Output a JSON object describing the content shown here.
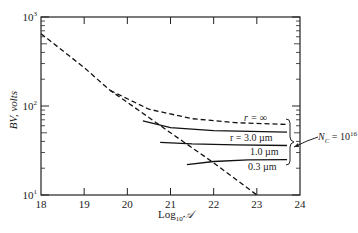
{
  "chart_data": {
    "type": "line",
    "title": "",
    "xlabel": "Log10 𝒜",
    "ylabel": "BV, volts",
    "xlim": [
      18,
      24
    ],
    "ylim": [
      10,
      1000
    ],
    "yscale": "log",
    "grid": false,
    "x_ticks": [
      "18",
      "19",
      "20",
      "21",
      "22",
      "23",
      "24"
    ],
    "y_ticks": [
      {
        "base": "10",
        "exp": "1"
      },
      {
        "base": "10",
        "exp": "2"
      },
      {
        "base": "10",
        "exp": "3"
      }
    ],
    "series": [
      {
        "name": "planar limit (dashed)",
        "style": "dashed",
        "points": [
          [
            18,
            650
          ],
          [
            19,
            270
          ],
          [
            19.6,
            150
          ],
          [
            20,
            110
          ],
          [
            21,
            50
          ],
          [
            22,
            23
          ],
          [
            23,
            10
          ]
        ]
      },
      {
        "name": "r = ∞",
        "style": "dashed",
        "points": [
          [
            19.6,
            150
          ],
          [
            20.5,
            92
          ],
          [
            21.5,
            72
          ],
          [
            22.5,
            65
          ],
          [
            23.7,
            62
          ]
        ]
      },
      {
        "name": "r = 3.0 µm",
        "style": "solid",
        "points": [
          [
            20.36,
            68
          ],
          [
            21,
            57
          ],
          [
            22,
            53
          ],
          [
            23.7,
            51
          ]
        ]
      },
      {
        "name": "1.0 µm",
        "style": "solid",
        "points": [
          [
            20.76,
            39
          ],
          [
            21.5,
            37.5
          ],
          [
            22.5,
            36.5
          ],
          [
            23.7,
            36
          ]
        ]
      },
      {
        "name": "0.3 µm",
        "style": "solid",
        "points": [
          [
            21.38,
            22
          ],
          [
            22,
            23.8
          ],
          [
            22.8,
            24.8
          ],
          [
            23.7,
            25
          ]
        ]
      }
    ],
    "annotations": [
      {
        "text": "r = ∞"
      },
      {
        "text": "r = 3.0 µm"
      },
      {
        "text": "1.0 µm"
      },
      {
        "text": "0.3 µm"
      },
      {
        "text": "N_C = 10^16",
        "parts": {
          "n": "N",
          "sub": "C",
          "eq": " = 10",
          "sup": "16"
        }
      }
    ]
  },
  "labels": {
    "ylabel": "BV, volts",
    "xlabel_main": "Log",
    "xlabel_sub": "10",
    "xlabel_symbol": "𝒜",
    "r_inf": "r = ∞",
    "r_3": "r = 3.0 µm",
    "r_1": "1.0 µm",
    "r_03": "0.3 µm",
    "nc_n": "N",
    "nc_sub": "C",
    "nc_eq": " = 10",
    "nc_sup": "16"
  }
}
